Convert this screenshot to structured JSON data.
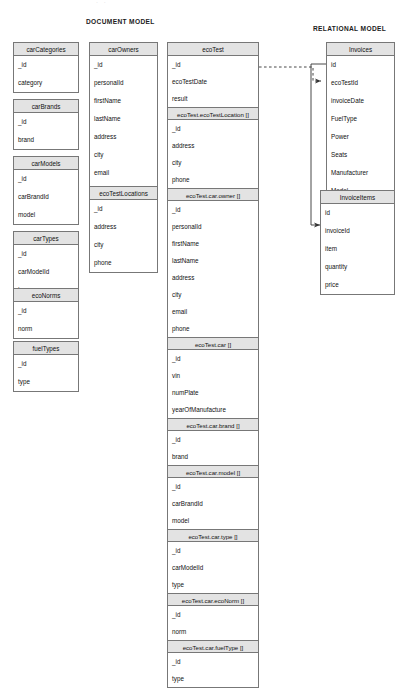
{
  "diagram": {
    "kind": "entity-relationship-comparison",
    "sections": {
      "document_model_title": "DOCUMENT MODEL",
      "relational_model_title": "RELATIONAL MODEL"
    },
    "artifact_text": "· ·"
  },
  "document_model": {
    "collections": [
      {
        "name": "carCategories",
        "fields": [
          "_id",
          "category"
        ]
      },
      {
        "name": "carBrands",
        "fields": [
          "_id",
          "brand"
        ]
      },
      {
        "name": "carModels",
        "fields": [
          "_id",
          "carBrandId",
          "model"
        ]
      },
      {
        "name": "carTypes",
        "fields": [
          "_id",
          "carModelId",
          "type"
        ]
      },
      {
        "name": "ecoNorms",
        "fields": [
          "_id",
          "norm"
        ]
      },
      {
        "name": "fuelTypes",
        "fields": [
          "_id",
          "type"
        ]
      },
      {
        "name": "carOwners",
        "fields": [
          "_id",
          "personalId",
          "firstName",
          "lastName",
          "address",
          "city",
          "email",
          "phone"
        ]
      },
      {
        "name": "ecoTestLocations",
        "fields": [
          "_id",
          "address",
          "city",
          "phone"
        ]
      }
    ],
    "eco_test": {
      "name": "ecoTest",
      "root_fields": [
        "_id",
        "ecoTestDate",
        "result"
      ],
      "embedded": [
        {
          "name": "ecoTest.ecoTestLocation []",
          "fields": [
            "_id",
            "address",
            "city",
            "phone"
          ]
        },
        {
          "name": "ecoTest.car.owner []",
          "fields": [
            "_id",
            "personalId",
            "firstName",
            "lastName",
            "address",
            "city",
            "email",
            "phone"
          ]
        },
        {
          "name": "ecoTest.car []",
          "fields": [
            "_id",
            "vin",
            "numPlate",
            "yearOfManufacture"
          ]
        },
        {
          "name": "ecoTest.car.brand []",
          "fields": [
            "_id",
            "brand"
          ]
        },
        {
          "name": "ecoTest.car.model []",
          "fields": [
            "_id",
            "carBrandId",
            "model"
          ]
        },
        {
          "name": "ecoTest.car.type []",
          "fields": [
            "_id",
            "carModelId",
            "type"
          ]
        },
        {
          "name": "ecoTest.car.ecoNorm []",
          "fields": [
            "_id",
            "norm"
          ]
        },
        {
          "name": "ecoTest.car.fuelType []",
          "fields": [
            "_id",
            "type"
          ]
        }
      ]
    }
  },
  "relational_model": {
    "tables": [
      {
        "name": "Invoices",
        "fields": [
          "id",
          "ecoTestId",
          "invoiceDate",
          "FuelType",
          "Power",
          "Seats",
          "Manufacturer",
          "Model"
        ]
      },
      {
        "name": "InvoiceItems",
        "fields": [
          "id",
          "invoiceId",
          "item",
          "quantity",
          "price"
        ]
      }
    ]
  },
  "relationships": [
    {
      "from": "ecoTest._id",
      "to": "Invoices.ecoTestId",
      "style": "dashed",
      "arrow": "to"
    },
    {
      "from": "Invoices.id",
      "to": "InvoiceItems.invoiceId",
      "style": "solid",
      "arrow": "to"
    }
  ],
  "colors": {
    "header_fill": "#e3e3e3",
    "border": "#777777",
    "background": "#ffffff",
    "text": "#111111"
  }
}
